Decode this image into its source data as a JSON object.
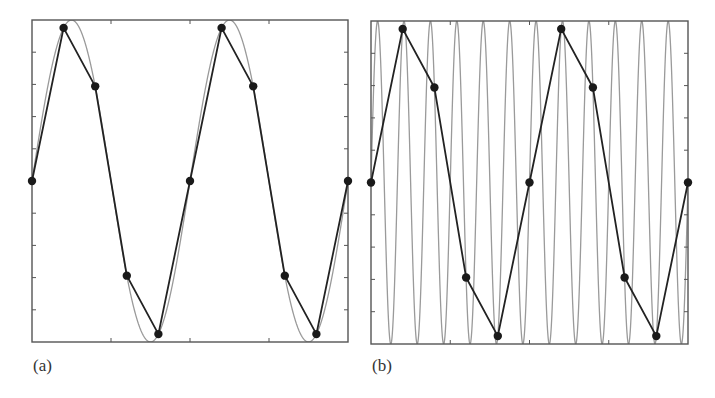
{
  "figure": {
    "background": "#ffffff",
    "colors": {
      "axes": "#555555",
      "continuous_signal": "#9a9a9a",
      "sampled_signal": "#222222",
      "sample_marker": "#1a1a1a"
    }
  },
  "chart_data": [
    {
      "type": "line",
      "panel_label": "(a)",
      "title": "",
      "xlabel": "",
      "ylabel": "",
      "xlim": [
        0,
        10
      ],
      "ylim": [
        -1,
        1
      ],
      "grid": false,
      "x_ticks_count": 5,
      "y_ticks_count": 11,
      "tick_labels_visible": false,
      "series": [
        {
          "name": "continuous signal",
          "style": "thin gray line",
          "frequency_cycles_per_sample": 0.2,
          "function": "sin(2*pi*0.2*x)",
          "cycles_shown": 2
        },
        {
          "name": "samples",
          "style": "black line with filled circle markers",
          "x": [
            0,
            1,
            2,
            3,
            4,
            5,
            6,
            7,
            8,
            9,
            10
          ],
          "values": [
            0,
            0.951,
            0.588,
            -0.588,
            -0.951,
            0,
            0.951,
            0.588,
            -0.588,
            -0.951,
            0
          ]
        }
      ]
    },
    {
      "type": "line",
      "panel_label": "(b)",
      "title": "",
      "xlabel": "",
      "ylabel": "",
      "xlim": [
        0,
        10
      ],
      "ylim": [
        -1,
        1
      ],
      "grid": false,
      "x_ticks_count": 5,
      "y_ticks_count": 11,
      "tick_labels_visible": false,
      "series": [
        {
          "name": "continuous signal",
          "style": "thin gray line",
          "frequency_cycles_per_sample": 1.2,
          "function": "sin(2*pi*1.2*x)",
          "cycles_shown": 12
        },
        {
          "name": "samples",
          "style": "black line with filled circle markers",
          "x": [
            0,
            1,
            2,
            3,
            4,
            5,
            6,
            7,
            8,
            9,
            10
          ],
          "values": [
            0,
            0.951,
            0.588,
            -0.588,
            -0.951,
            0,
            0.951,
            0.588,
            -0.588,
            -0.951,
            0
          ]
        }
      ]
    }
  ],
  "layout": {
    "panels": [
      {
        "box": [
          32,
          20,
          316,
          322
        ],
        "label_pos": [
          33,
          356
        ]
      },
      {
        "box": [
          11,
          21,
          317,
          323
        ],
        "label_pos": [
          12,
          356
        ]
      }
    ]
  }
}
